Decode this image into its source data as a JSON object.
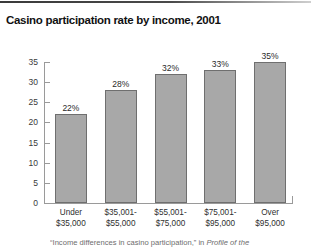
{
  "top_rule": {
    "color": "#3a3a3a"
  },
  "title": "Casino participation rate by income, 2001",
  "source_note": {
    "prefix": "“Income differences in casino participation,” in ",
    "italic": "Profile of the"
  },
  "colors": {
    "bar_fill": "#a8a8a8",
    "bar_outline": "#6f6f6f",
    "axis": "#9a9a9a",
    "title": "#111111",
    "text": "#2f2f2f"
  },
  "chart_data": {
    "type": "bar",
    "title": "Casino participation rate by income, 2001",
    "xlabel": "",
    "ylabel": "",
    "ylim": [
      0,
      35
    ],
    "yticks": [
      0,
      5,
      10,
      15,
      20,
      25,
      30,
      35
    ],
    "ytick_labels": [
      "0",
      "5",
      "10",
      "15",
      "20",
      "25",
      "30",
      "35"
    ],
    "grid": false,
    "legend": "none",
    "categories": [
      "Under $35,000",
      "$35,001-$55,000",
      "$55,001-$75,000",
      "$75,001-$95,000",
      "Over $95,000"
    ],
    "category_lines": [
      [
        "Under",
        "$35,000"
      ],
      [
        "$35,001-",
        "$55,000"
      ],
      [
        "$55,001-",
        "$75,000"
      ],
      [
        "$75,001-",
        "$95,000"
      ],
      [
        "Over",
        "$95,000"
      ]
    ],
    "values": [
      22,
      28,
      32,
      33,
      35
    ],
    "data_labels": [
      "22%",
      "28%",
      "32%",
      "33%",
      "35%"
    ]
  }
}
